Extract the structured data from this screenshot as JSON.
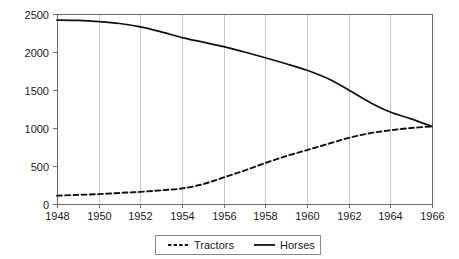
{
  "chart_data": {
    "type": "line",
    "title": "",
    "subtitle": "",
    "xlabel": "",
    "ylabel": "",
    "xlim": [
      1948,
      1966
    ],
    "ylim": [
      0,
      2500
    ],
    "grid": "vertical",
    "legend_position": "bottom-center",
    "x_tick_labels": [
      "1948",
      "1950",
      "1952",
      "1954",
      "1956",
      "1958",
      "1960",
      "1962",
      "1964",
      "1966"
    ],
    "y_tick_labels": [
      "0",
      "500",
      "1000",
      "1500",
      "2000",
      "2500"
    ],
    "x_ticks": [
      1948,
      1950,
      1952,
      1954,
      1956,
      1958,
      1960,
      1962,
      1964,
      1966
    ],
    "y_ticks": [
      0,
      500,
      1000,
      1500,
      2000,
      2500
    ],
    "x": [
      1948,
      1949,
      1950,
      1951,
      1952,
      1953,
      1954,
      1955,
      1956,
      1957,
      1958,
      1959,
      1960,
      1961,
      1962,
      1963,
      1964,
      1965,
      1966
    ],
    "series": [
      {
        "name": "Tractors",
        "style": "dashed",
        "color": "#111111",
        "values": [
          110,
          120,
          130,
          145,
          160,
          180,
          205,
          260,
          350,
          440,
          540,
          630,
          710,
          790,
          870,
          930,
          970,
          1000,
          1020
        ]
      },
      {
        "name": "Horses",
        "style": "solid",
        "color": "#111111",
        "values": [
          2420,
          2415,
          2400,
          2375,
          2330,
          2265,
          2190,
          2130,
          2070,
          2000,
          1925,
          1845,
          1760,
          1650,
          1500,
          1340,
          1210,
          1120,
          1020
        ]
      }
    ],
    "legend": [
      {
        "label": "Tractors",
        "style": "dashed"
      },
      {
        "label": "Horses",
        "style": "solid"
      }
    ]
  },
  "colors": {
    "background": "#ffffff",
    "grid": "#b9b9b9",
    "axis": "#6b6b6b",
    "line": "#111111",
    "text": "#1a1a1a",
    "legend_border": "#8a8a8a"
  }
}
